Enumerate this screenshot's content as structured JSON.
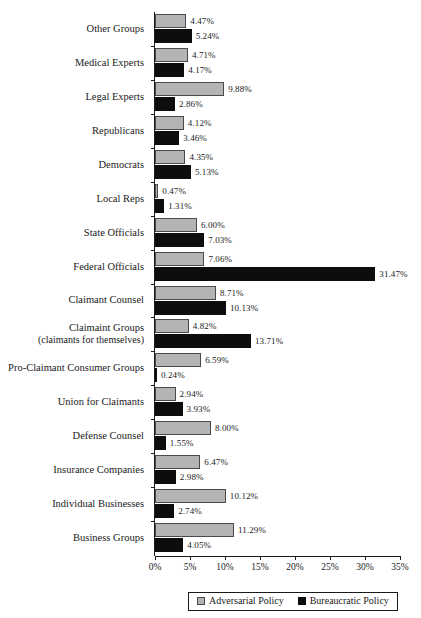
{
  "chart_data": {
    "type": "bar",
    "title": "",
    "subtitle": "",
    "xlabel": "",
    "ylabel": "",
    "orientation": "horizontal",
    "grid": false,
    "xlim": [
      0,
      35
    ],
    "xtick_labels": [
      "0%",
      "5%",
      "10%",
      "15%",
      "20%",
      "25%",
      "30%",
      "35%"
    ],
    "xtick_values": [
      0,
      5,
      10,
      15,
      20,
      25,
      30,
      35
    ],
    "legend_position": "bottom",
    "categories": [
      "Other  Groups",
      "Medical Experts",
      "Legal Experts",
      "Republicans",
      "Democrats",
      "Local Reps",
      "State Officials",
      "Federal Officials",
      "Claimant Counsel",
      "Claimaint Groups",
      "Pro-Claimant Consumer Groups",
      "Union for Claimants",
      "Defense Counsel",
      "Insurance Companies",
      "Individual Businesses",
      "Business Groups"
    ],
    "category_sublabels": [
      "",
      "",
      "",
      "",
      "",
      "",
      "",
      "",
      "",
      "(claimants for themselves)",
      "",
      "",
      "",
      "",
      "",
      ""
    ],
    "series": [
      {
        "name": "Adversarial Policy",
        "color": "#b4b4b4",
        "values": [
          4.47,
          4.71,
          9.88,
          4.12,
          4.35,
          0.47,
          6.0,
          7.06,
          8.71,
          4.82,
          6.59,
          2.94,
          8.0,
          6.47,
          10.12,
          11.29
        ],
        "labels": [
          "4.47%",
          "4.71%",
          "9.88%",
          "4.12%",
          "4.35%",
          "0.47%",
          "6.00%",
          "7.06%",
          "8.71%",
          "4.82%",
          "6.59%",
          "2.94%",
          "8.00%",
          "6.47%",
          "10.12%",
          "11.29%"
        ]
      },
      {
        "name": "Bureaucratic Policy",
        "color": "#0d0d0d",
        "values": [
          5.24,
          4.17,
          2.86,
          3.46,
          5.13,
          1.31,
          7.03,
          31.47,
          10.13,
          13.71,
          0.24,
          3.93,
          1.55,
          2.98,
          2.74,
          4.05
        ],
        "labels": [
          "5.24%",
          "4.17%",
          "2.86%",
          "3.46%",
          "5.13%",
          "1.31%",
          "7.03%",
          "31.47%",
          "10.13%",
          "13.71%",
          "0.24%",
          "3.93%",
          "1.55%",
          "2.98%",
          "2.74%",
          "4.05%"
        ]
      }
    ]
  },
  "legend": {
    "items": [
      {
        "label": "Adversarial Policy",
        "swatch": "adversarial"
      },
      {
        "label": "Bureaucratic Policy",
        "swatch": "bureaucratic"
      }
    ]
  }
}
